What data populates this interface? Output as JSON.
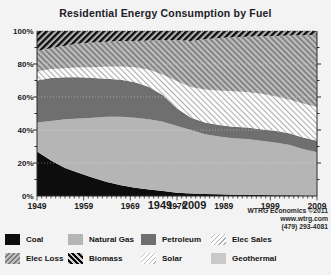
{
  "title": "Residential Energy Consumption by Fuel",
  "x_axis_title": "1949 - 2009",
  "watermark": {
    "line1": "WTRG Economics ©2011",
    "line2": "www.wtrg.com",
    "line3": "(479) 293-4081"
  },
  "colors": {
    "coal": "#0d0d0d",
    "natural_gas": "#b5b5b5",
    "petroleum": "#6f6f6f",
    "elec_sales_line": "#aeaeae",
    "elec_loss_bg": "#bebebe",
    "elec_loss_line": "#777777",
    "biomass_line": "#0b0b0b",
    "geothermal": "#c9c9c9",
    "axis": "#2a2a2a"
  },
  "chart_data": {
    "type": "area",
    "stacked": true,
    "unit": "percent of total",
    "title": "Residential Energy Consumption by Fuel",
    "xlabel": "1949 - 2009",
    "ylabel": "",
    "ylim": [
      0,
      100
    ],
    "grid": "dotted horizontal at 20% steps",
    "legend_position": "bottom",
    "x": [
      1949,
      1952,
      1955,
      1958,
      1961,
      1964,
      1967,
      1970,
      1973,
      1976,
      1979,
      1982,
      1985,
      1988,
      1991,
      1994,
      1997,
      2000,
      2003,
      2006,
      2009
    ],
    "xticks": [
      1949,
      1959,
      1969,
      1979,
      1989,
      1999,
      2009
    ],
    "yticks": [
      "0%",
      "20%",
      "40%",
      "60%",
      "80%",
      "100%"
    ],
    "series": [
      {
        "name": "Coal",
        "swatch": "coal",
        "fill": "#0d0d0d",
        "values": [
          27,
          21.5,
          17,
          14,
          11,
          8.5,
          6.5,
          5,
          4,
          3,
          2,
          1.5,
          1.2,
          1,
          0.8,
          0.7,
          0.6,
          0.5,
          0.4,
          0.3,
          0.2
        ]
      },
      {
        "name": "Natural Gas",
        "swatch": "natural-gas",
        "fill": "#b5b5b5",
        "values": [
          17.5,
          24,
          29.5,
          33,
          36.5,
          39.5,
          41.5,
          42.5,
          42.5,
          42,
          40.5,
          38.5,
          36.3,
          35,
          34.2,
          33.8,
          32.9,
          32,
          30.6,
          28.2,
          26.3
        ]
      },
      {
        "name": "Petroleum",
        "swatch": "petroleum",
        "fill": "#6f6f6f",
        "values": [
          25.5,
          26,
          25.5,
          25,
          24,
          23,
          22.5,
          21.5,
          19.5,
          16,
          10.5,
          7.5,
          7,
          7,
          7,
          7,
          7,
          7,
          7,
          7,
          7
        ]
      },
      {
        "name": "Elec Sales",
        "swatch": "elec-sales",
        "fill": "pattern:sales",
        "values": [
          5.5,
          5.5,
          5.5,
          6,
          6.5,
          7.5,
          8,
          9,
          10.5,
          12.5,
          16.5,
          18.5,
          20,
          21,
          21.5,
          21.5,
          21.5,
          21,
          20.5,
          20.5,
          20.5
        ]
      },
      {
        "name": "Elec Loss",
        "swatch": "elec-loss",
        "fill": "pattern:loss",
        "values": [
          12.5,
          12.5,
          13.5,
          14.5,
          15,
          15,
          15.5,
          16,
          17.8,
          21,
          25,
          28,
          30.5,
          31.8,
          32.7,
          33.5,
          34.8,
          36.5,
          38.7,
          41.5,
          43.7
        ]
      },
      {
        "name": "Biomass",
        "swatch": "biomass",
        "fill": "pattern:bio",
        "values": [
          12,
          10.5,
          9,
          7.5,
          7,
          6.5,
          6,
          6,
          5.7,
          5.5,
          5.5,
          6,
          5,
          4.2,
          3.8,
          3.5,
          3.2,
          3,
          2.8,
          2.5,
          2.3
        ]
      },
      {
        "name": "Solar",
        "swatch": "solar",
        "fill": "pattern:sales",
        "values": [
          0,
          0,
          0,
          0,
          0,
          0,
          0,
          0,
          0,
          0,
          0,
          0,
          0,
          0,
          0,
          0,
          0,
          0,
          0,
          0,
          0
        ]
      },
      {
        "name": "Geothermal",
        "swatch": "geothermal",
        "fill": "#c9c9c9",
        "values": [
          0,
          0,
          0,
          0,
          0,
          0,
          0,
          0,
          0,
          0,
          0,
          0,
          0,
          0,
          0,
          0,
          0,
          0,
          0,
          0,
          0
        ]
      }
    ]
  },
  "legend": {
    "items": [
      {
        "label": "Coal",
        "swatch": "coal"
      },
      {
        "label": "Natural Gas",
        "swatch": "natural-gas"
      },
      {
        "label": "Petroleum",
        "swatch": "petroleum"
      },
      {
        "label": "Elec Sales",
        "swatch": "elec-sales"
      },
      {
        "label": "Elec Loss",
        "swatch": "elec-loss"
      },
      {
        "label": "Biomass",
        "swatch": "biomass"
      },
      {
        "label": "Solar",
        "swatch": "solar"
      },
      {
        "label": "Geothermal",
        "swatch": "geothermal"
      }
    ]
  }
}
